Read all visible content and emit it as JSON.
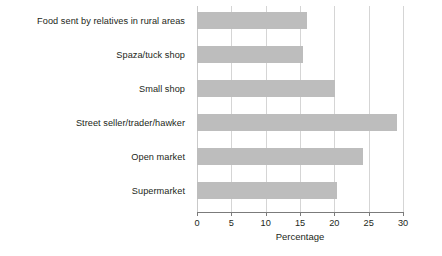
{
  "chart_data": {
    "type": "bar",
    "orientation": "horizontal",
    "title": "",
    "subtitle": "",
    "xlabel": "Percentage",
    "ylabel": "",
    "categories": [
      "Supermarket",
      "Open market",
      "Street seller/trader/hawker",
      "Small shop",
      "Spaza/tuck shop",
      "Food sent by relatives in rural areas"
    ],
    "values": [
      20.4,
      24.2,
      29.1,
      20.1,
      15.4,
      16.0
    ],
    "series": [
      {
        "name": "Percentage",
        "values": [
          20.4,
          24.2,
          29.1,
          20.1,
          15.4,
          16.0
        ]
      }
    ],
    "xlim": [
      0,
      30
    ],
    "xticks": [
      0,
      5,
      10,
      15,
      20,
      25,
      30
    ],
    "xtick_labels": [
      "0",
      "5",
      "10",
      "15",
      "20",
      "25",
      "30"
    ],
    "grid": "vertical",
    "legend": null,
    "bar_color": "#bdbdbd",
    "grid_color": "#d5d5d5",
    "axis_color": "#7b7b7b",
    "text_color": "#231f20",
    "background": "#ffffff"
  }
}
